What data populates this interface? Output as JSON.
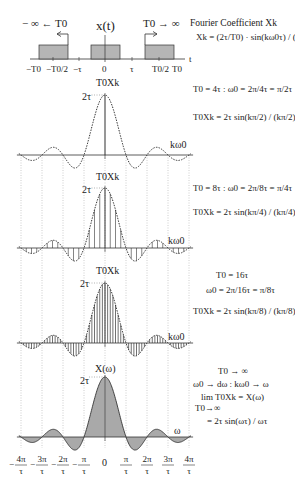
{
  "top": {
    "signal_label": "x(t)",
    "left_arrow_label": "− ∞ ← T0",
    "right_arrow_label": "T0 → ∞",
    "time_axis_label": "t",
    "ticks": [
      "−T0",
      "−T0/2",
      "−τ",
      "0",
      "τ",
      "T0/2",
      "T0"
    ]
  },
  "header": {
    "title": "Fourier Coefficient Xk",
    "formula": "Xk = (2τ/T0) · sin(kω0τ) / (kω0τ)"
  },
  "panels": [
    {
      "y_label": "T0Xk",
      "peak_label": "2τ",
      "x_label": "kω0",
      "eq_line1": "T0 = 4τ : ω0 = 2π/4τ = π/2τ",
      "eq_line2": "T0Xk = 2τ sin(kπ/2) / (kπ/2)",
      "samples_per_pi": 0.5
    },
    {
      "y_label": "T0Xk",
      "peak_label": "2τ",
      "x_label": "kω0",
      "eq_line1": "T0 = 8τ : ω0 = 2π/8τ = π/4τ",
      "eq_line2": "T0Xk = 2τ sin(kπ/4) / (kπ/4)",
      "samples_per_pi": 4
    },
    {
      "y_label": "T0Xk",
      "peak_label": "2τ",
      "x_label": "kω0",
      "eq_line1": "T0 = 16τ",
      "eq_line2": "ω0 = 2π/16τ = π/8τ",
      "eq_line3": "T0Xk = 2τ sin(kπ/8) / (kπ/8)",
      "samples_per_pi": 8
    },
    {
      "y_label": "X(ω)",
      "peak_label": "2τ",
      "x_label": "ω",
      "eq_line1": "T0 → ∞",
      "eq_line2": "ω0 → dω : kω0 → ω",
      "eq_line3": "lim T0Xk = X(ω)",
      "eq_line4": "T0→∞",
      "eq_line5": "= 2τ sin(ωτ) / ωτ"
    }
  ],
  "bottom_axis": {
    "ticks": [
      "−4π/τ",
      "−3π/τ",
      "−2π/τ",
      "−π/τ",
      "0",
      "π/τ",
      "2π/τ",
      "3π/τ",
      "4π/τ"
    ]
  },
  "colors": {
    "fill": "#a9a9a9",
    "line": "#333333",
    "grid": "#999999"
  }
}
